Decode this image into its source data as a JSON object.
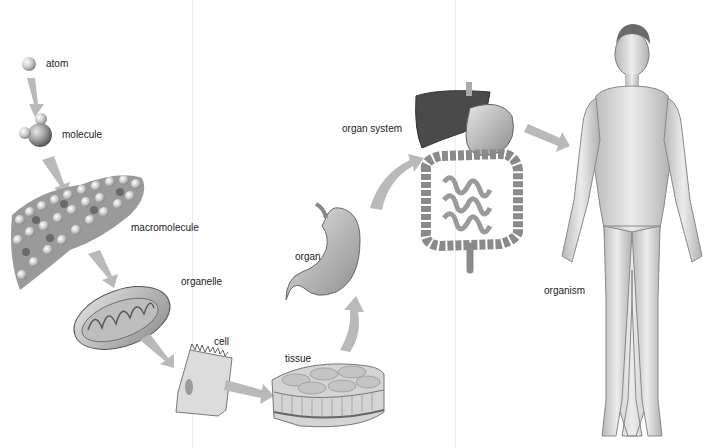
{
  "diagram": {
    "levels": [
      {
        "id": "atom",
        "label": "atom"
      },
      {
        "id": "molecule",
        "label": "molecule"
      },
      {
        "id": "macromolecule",
        "label": "macromolecule"
      },
      {
        "id": "organelle",
        "label": "organelle"
      },
      {
        "id": "cell",
        "label": "cell"
      },
      {
        "id": "tissue",
        "label": "tissue"
      },
      {
        "id": "organ",
        "label": "organ"
      },
      {
        "id": "organ_system",
        "label": "organ system"
      },
      {
        "id": "organism",
        "label": "organism"
      }
    ],
    "colors": {
      "arrow": "#b9b9b9",
      "text": "#222222",
      "illustration_light": "#d8d8d8",
      "illustration_dark": "#4a4a4a",
      "background": "#ffffff"
    }
  }
}
